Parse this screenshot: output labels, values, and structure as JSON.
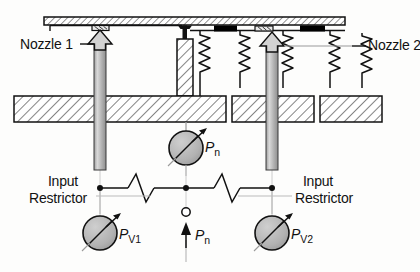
{
  "figure": {
    "type": "technical-schematic",
    "background_color": "#fdfdfc",
    "line_color": "#111111",
    "hatch_color": "#333333",
    "gauge_fill": "#b0b0b0",
    "arrow_fill": "#c9c9c9",
    "seal_fill": "#000000"
  },
  "labels": {
    "nozzle_left": "Nozzle 1",
    "nozzle_right": "Nozzle 2",
    "input_restrictor_left_line1": "Input",
    "input_restrictor_left_line2": "Restrictor",
    "input_restrictor_right_line1": "Input",
    "input_restrictor_right_line2": "Restrictor"
  },
  "pressures": {
    "nozzle_gauge": {
      "symbol": "P",
      "subscript": "n"
    },
    "supply_arrow": {
      "symbol": "P",
      "subscript": "n"
    },
    "gauge_left": {
      "symbol": "P",
      "subscript": "V1"
    },
    "gauge_right": {
      "symbol": "P",
      "subscript": "V2"
    }
  },
  "components": {
    "top_plate": "hatched-guide-rail",
    "base_blocks": [
      "base-block-left",
      "base-block-mid-right",
      "base-block-right"
    ],
    "springs_count": 5,
    "seals_count": 2,
    "nozzle_pads_count": 2,
    "resistors_count": 2,
    "flow_arrows_count": 2
  }
}
